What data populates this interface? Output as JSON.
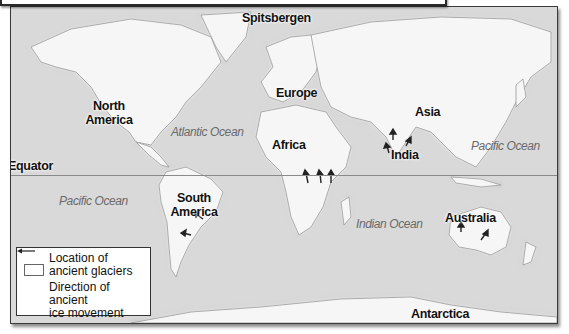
{
  "map": {
    "title": "Distribution of ancient glaciers",
    "continents": [
      {
        "id": "north-america",
        "label": "North America"
      },
      {
        "id": "south-america",
        "label": "South America"
      },
      {
        "id": "europe",
        "label": "Europe"
      },
      {
        "id": "africa",
        "label": "Africa"
      },
      {
        "id": "asia",
        "label": "Asia"
      },
      {
        "id": "india",
        "label": "India"
      },
      {
        "id": "australia",
        "label": "Australia"
      },
      {
        "id": "antarctica",
        "label": "Antarctica"
      }
    ],
    "islands": [
      {
        "id": "spitsbergen",
        "label": "Spitsbergen"
      }
    ],
    "oceans": [
      {
        "id": "atlantic",
        "label": "Atlantic Ocean"
      },
      {
        "id": "pacific-east",
        "label": "Pacific Ocean"
      },
      {
        "id": "pacific-west",
        "label": "Pacific Ocean"
      },
      {
        "id": "indian",
        "label": "Indian Ocean"
      }
    ],
    "lines": {
      "equator": "Equator"
    },
    "colors": {
      "ocean": "#d9d9d9",
      "land": "#f7f7f7",
      "border": "#333333",
      "arrow": "#222222"
    }
  },
  "legend": {
    "glacier_label_line1": "Location of",
    "glacier_label_line2": "ancient glaciers",
    "movement_label_line1": "Direction of ancient",
    "movement_label_line2": "ice movement"
  }
}
